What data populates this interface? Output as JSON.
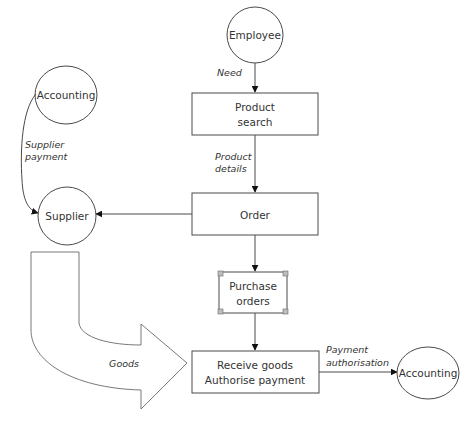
{
  "diagram": {
    "type": "data-flow",
    "nodes": {
      "employee": {
        "label": "Employee",
        "shape": "circle"
      },
      "accounting_top": {
        "label": "Accounting",
        "shape": "ellipse"
      },
      "supplier": {
        "label": "Supplier",
        "shape": "circle"
      },
      "accounting_bottom": {
        "label": "Accounting",
        "shape": "ellipse"
      },
      "product_search": {
        "line1": "Product",
        "line2": "search",
        "shape": "rectangle"
      },
      "order": {
        "label": "Order",
        "shape": "rectangle"
      },
      "purchase_orders": {
        "line1": "Purchase",
        "line2": "orders",
        "shape": "document-store"
      },
      "receive_goods": {
        "line1": "Receive goods",
        "line2": "Authorise payment",
        "shape": "rectangle"
      }
    },
    "edges": {
      "need": {
        "label": "Need",
        "from": "Employee",
        "to": "Product search"
      },
      "product_details": {
        "line1": "Product",
        "line2": "details",
        "from": "Product search",
        "to": "Order"
      },
      "order_to_supplier": {
        "label": "",
        "from": "Order",
        "to": "Supplier"
      },
      "supplier_payment": {
        "line1": "Supplier",
        "line2": "payment",
        "from": "Accounting",
        "to": "Supplier"
      },
      "order_to_po": {
        "label": "",
        "from": "Order",
        "to": "Purchase orders"
      },
      "po_to_receive": {
        "label": "",
        "from": "Purchase orders",
        "to": "Receive goods"
      },
      "goods": {
        "label": "Goods",
        "from": "Supplier",
        "to": "Receive goods",
        "style": "block-arrow"
      },
      "payment_authorisation": {
        "line1": "Payment",
        "line2": "authorisation",
        "from": "Receive goods",
        "to": "Accounting"
      }
    }
  }
}
